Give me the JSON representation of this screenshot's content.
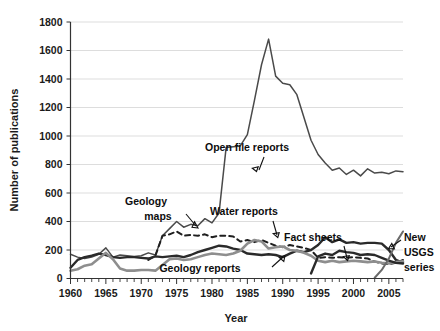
{
  "chart_data": {
    "type": "line",
    "title": "",
    "xlabel": "Year",
    "ylabel": "Number of publications",
    "xlim": [
      1960,
      2007
    ],
    "ylim": [
      0,
      1800
    ],
    "ytick_step": 200,
    "grid": true,
    "legend_position": "inline-annotations",
    "xticks": [
      1960,
      1965,
      1970,
      1975,
      1980,
      1985,
      1990,
      1995,
      2000,
      2005
    ],
    "xtick_labels": [
      "1960",
      "1965",
      "1970",
      "1975",
      "1980",
      "1985",
      "1990",
      "1995",
      "2000",
      "2005"
    ],
    "yticks": [
      0,
      200,
      400,
      600,
      800,
      1000,
      1200,
      1400,
      1600,
      1800
    ],
    "ytick_labels": [
      "0",
      "200",
      "400",
      "600",
      "800",
      "1000",
      "1200",
      "1400",
      "1600",
      "1800"
    ],
    "x": [
      1960,
      1961,
      1962,
      1963,
      1964,
      1965,
      1966,
      1967,
      1968,
      1969,
      1970,
      1971,
      1972,
      1973,
      1974,
      1975,
      1976,
      1977,
      1978,
      1979,
      1980,
      1981,
      1982,
      1983,
      1984,
      1985,
      1986,
      1987,
      1988,
      1989,
      1990,
      1991,
      1992,
      1993,
      1994,
      1995,
      1996,
      1997,
      1998,
      1999,
      2000,
      2001,
      2002,
      2003,
      2004,
      2005,
      2006,
      2007
    ],
    "series": [
      {
        "name": "Open file reports",
        "color": "#4a4a4a",
        "width": 1.5,
        "dash": "none",
        "values": [
          170,
          150,
          140,
          150,
          170,
          215,
          150,
          165,
          160,
          155,
          160,
          180,
          165,
          300,
          350,
          400,
          360,
          380,
          370,
          420,
          390,
          460,
          920,
          925,
          930,
          1010,
          1250,
          1500,
          1680,
          1420,
          1370,
          1360,
          1290,
          1130,
          970,
          870,
          810,
          760,
          775,
          730,
          760,
          720,
          770,
          740,
          745,
          735,
          755,
          750
        ]
      },
      {
        "name": "Geology maps",
        "color": "#1f1f1f",
        "width": 2.0,
        "dash": "5,4",
        "values": [
          null,
          null,
          null,
          null,
          null,
          null,
          null,
          null,
          null,
          null,
          null,
          130,
          160,
          300,
          310,
          330,
          300,
          305,
          300,
          310,
          290,
          300,
          300,
          295,
          260,
          270,
          255,
          270,
          250,
          230,
          220,
          235,
          225,
          215,
          200,
          145,
          150,
          145,
          150,
          145,
          150,
          145,
          140,
          120,
          105,
          100,
          110,
          130
        ]
      },
      {
        "name": "Water reports",
        "color": "#2a2a2a",
        "width": 2.4,
        "dash": "none",
        "values": [
          75,
          130,
          150,
          160,
          175,
          165,
          150,
          145,
          150,
          150,
          145,
          140,
          155,
          150,
          155,
          160,
          150,
          165,
          185,
          200,
          215,
          230,
          225,
          210,
          200,
          175,
          170,
          165,
          170,
          165,
          150,
          175,
          195,
          185,
          200,
          235,
          290,
          255,
          275,
          250,
          255,
          245,
          250,
          250,
          245,
          200,
          130,
          110
        ]
      },
      {
        "name": "Geology reports",
        "color": "#8e8e8e",
        "width": 2.6,
        "dash": "none",
        "values": [
          55,
          65,
          90,
          100,
          140,
          180,
          135,
          70,
          55,
          55,
          60,
          60,
          55,
          95,
          135,
          140,
          130,
          135,
          150,
          165,
          175,
          170,
          165,
          175,
          195,
          245,
          270,
          260,
          210,
          220,
          225,
          200,
          195,
          180,
          160,
          125,
          115,
          125,
          115,
          120,
          125,
          120,
          115,
          120,
          110,
          105,
          115,
          120
        ]
      },
      {
        "name": "Fact sheets",
        "color": "#2a2a2a",
        "width": 2.4,
        "dash": "none",
        "values": [
          null,
          null,
          null,
          null,
          null,
          null,
          null,
          null,
          null,
          null,
          null,
          null,
          null,
          null,
          null,
          null,
          null,
          null,
          null,
          null,
          null,
          null,
          null,
          null,
          null,
          null,
          null,
          null,
          null,
          null,
          null,
          null,
          null,
          null,
          35,
          155,
          175,
          165,
          195,
          185,
          180,
          165,
          170,
          165,
          145,
          125,
          110,
          105
        ]
      },
      {
        "name": "New USGS series",
        "color": "#6a6a6a",
        "width": 2.0,
        "dash": "none",
        "values": [
          null,
          null,
          null,
          null,
          null,
          null,
          null,
          null,
          null,
          null,
          null,
          null,
          null,
          null,
          null,
          null,
          null,
          null,
          null,
          null,
          null,
          null,
          null,
          null,
          null,
          null,
          null,
          null,
          null,
          null,
          null,
          null,
          null,
          null,
          null,
          null,
          null,
          null,
          null,
          null,
          null,
          null,
          null,
          5,
          60,
          140,
          250,
          330
        ]
      }
    ],
    "annotations": [
      {
        "text": "Open file reports",
        "name": "annotation-open-file-reports",
        "x": 247,
        "y": 151
      },
      {
        "text": "Geology",
        "name": "annotation-geology-maps-line1",
        "x": 146,
        "y": 205
      },
      {
        "text": "maps",
        "name": "annotation-geology-maps-line2",
        "x": 158,
        "y": 220
      },
      {
        "text": "Water reports",
        "name": "annotation-water-reports",
        "x": 244,
        "y": 215
      },
      {
        "text": "Fact sheets",
        "name": "annotation-fact-sheets",
        "x": 313,
        "y": 241
      },
      {
        "text": "Geology reports",
        "name": "annotation-geology-reports",
        "x": 200,
        "y": 272
      },
      {
        "text": "New",
        "name": "annotation-new-usgs-line1",
        "x": 404,
        "y": 241
      },
      {
        "text": "USGS",
        "name": "annotation-new-usgs-line2",
        "x": 404,
        "y": 256
      },
      {
        "text": "series",
        "name": "annotation-new-usgs-line3",
        "x": 404,
        "y": 271
      }
    ]
  }
}
